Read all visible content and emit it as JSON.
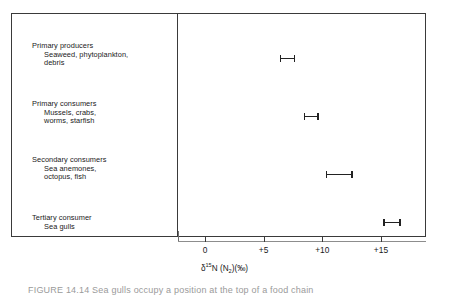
{
  "figure": {
    "axis_title_delta": "δ",
    "axis_title_sup": "15",
    "axis_title_n": "N",
    "axis_title_open": " (N",
    "axis_title_sub": "2",
    "axis_title_close": ")(‰)",
    "caption_partial": "FIGURE 14.14   Sea gulls occupy a position at the top of a food chain",
    "caption_label": "FIGURE 14.14"
  },
  "chart_data": {
    "type": "bar",
    "orientation": "horizontal",
    "title": "",
    "xlabel": "δ15N (N2)(‰)",
    "ylabel": "",
    "xlim": [
      -2,
      19
    ],
    "xticks": [
      0,
      5,
      10,
      15
    ],
    "xticklabels": [
      "0",
      "+5",
      "+10",
      "+15"
    ],
    "grid": false,
    "legend": false,
    "categories": [
      "Primary producers",
      "Primary consumers",
      "Secondary consumers",
      "Tertiary consumer"
    ],
    "series": [
      {
        "name": "δ15N range",
        "ranges": [
          {
            "low": 6.4,
            "high": 7.7
          },
          {
            "low": 8.4,
            "high": 9.7
          },
          {
            "low": 10.3,
            "high": 12.6
          },
          {
            "low": 15.2,
            "high": 16.7
          }
        ],
        "values": [
          7.05,
          9.05,
          11.45,
          15.95
        ]
      }
    ]
  },
  "groups": [
    {
      "head": "Primary producers",
      "lines": [
        "Seaweed, phytoplankton,",
        "debris"
      ],
      "label_top": 28,
      "bar_top": 41,
      "low": 6.4,
      "high": 7.7
    },
    {
      "head": "Primary consumers",
      "lines": [
        "Mussels, crabs,",
        "worms, starfish"
      ],
      "label_top": 86,
      "bar_top": 99,
      "low": 8.4,
      "high": 9.7
    },
    {
      "head": "Secondary consumers",
      "lines": [
        "Sea anemones,",
        "octopus, fish"
      ],
      "label_top": 142,
      "bar_top": 157,
      "low": 10.3,
      "high": 12.6
    },
    {
      "head": "Tertiary consumer",
      "lines": [
        "Sea gulls"
      ],
      "label_top": 200,
      "bar_top": 205,
      "low": 15.2,
      "high": 16.7
    }
  ]
}
